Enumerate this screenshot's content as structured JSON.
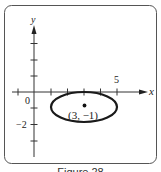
{
  "figure": {
    "caption": "Figure 28",
    "axes": {
      "x_label": "x",
      "y_label": "y",
      "origin_label": "0",
      "x_tick_label": "5",
      "y_tick_label": "−2"
    },
    "point": {
      "label": "(3, −1)",
      "x": 3,
      "y": -1
    },
    "ellipse": {
      "center_x": 3,
      "center_y": -1,
      "semi_axis_x": 2,
      "semi_axis_y": 1
    },
    "colors": {
      "stroke": "#1a1a1a",
      "frame": "#555555",
      "background": "#ffffff"
    }
  }
}
